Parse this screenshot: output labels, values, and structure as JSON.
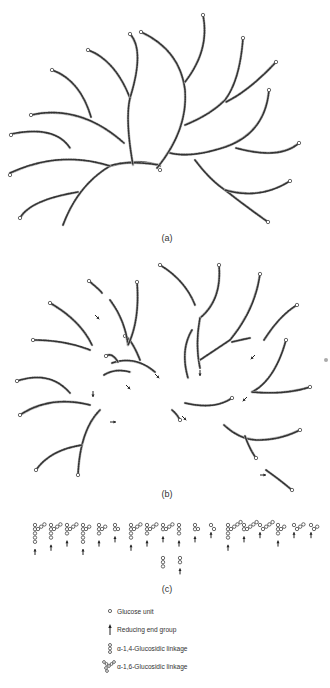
{
  "figure": {
    "panels": [
      {
        "id": "a",
        "label": "(a)"
      },
      {
        "id": "b",
        "label": "(b)"
      },
      {
        "id": "c",
        "label": "(c)"
      }
    ],
    "legend": [
      {
        "symbol": "glucose-unit",
        "text": "Glucose unit"
      },
      {
        "symbol": "reducing-end-arrow",
        "text": "Reducing end group"
      },
      {
        "symbol": "alpha-1-4-linkage",
        "text": "α-1,4-Glucosidic linkage"
      },
      {
        "symbol": "alpha-1-6-linkage",
        "text": "α-1,6-Glucosidic linkage"
      }
    ]
  }
}
